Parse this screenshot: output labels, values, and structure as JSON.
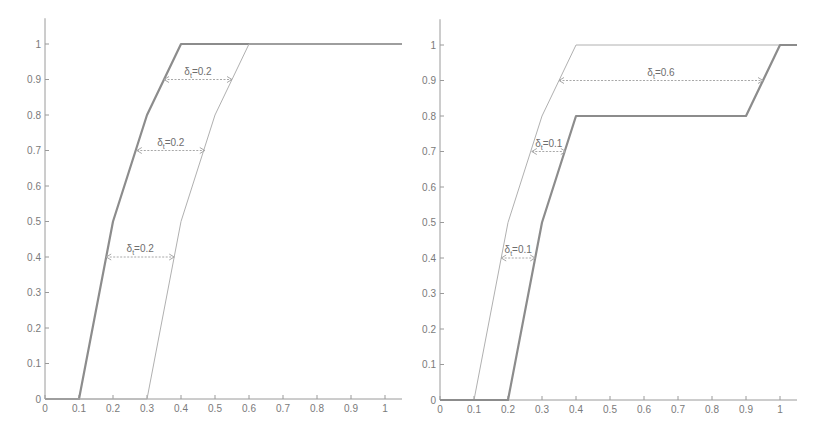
{
  "chart_data": [
    {
      "type": "line",
      "title": "",
      "xlabel": "",
      "ylabel": "",
      "xlim": [
        0,
        1.05
      ],
      "ylim": [
        0,
        1.05
      ],
      "grid": false,
      "x_ticks": [
        "0",
        "0.1",
        "0.2",
        "0.3",
        "0.4",
        "0.5",
        "0.6",
        "0.7",
        "0.8",
        "0.9",
        "1"
      ],
      "y_ticks": [
        "0",
        "0.1",
        "0.2",
        "0.3",
        "0.4",
        "0.5",
        "0.6",
        "0.7",
        "0.8",
        "0.9",
        "1"
      ],
      "series": [
        {
          "name": "thick",
          "style": "thick",
          "x": [
            0,
            0.1,
            0.2,
            0.3,
            0.4,
            1.05
          ],
          "y": [
            0,
            0,
            0.5,
            0.8,
            1.0,
            1.0
          ]
        },
        {
          "name": "thin",
          "style": "thin",
          "x": [
            0,
            0.3,
            0.4,
            0.5,
            0.6,
            1.05
          ],
          "y": [
            0,
            0,
            0.5,
            0.8,
            1.0,
            1.0
          ]
        }
      ],
      "annotations": [
        {
          "label": "δt=0.2",
          "y": 0.9,
          "x_from": 0.35,
          "x_to": 0.55
        },
        {
          "label": "δt=0.2",
          "y": 0.7,
          "x_from": 0.27,
          "x_to": 0.47
        },
        {
          "label": "δt=0.2",
          "y": 0.4,
          "x_from": 0.18,
          "x_to": 0.38
        }
      ]
    },
    {
      "type": "line",
      "title": "",
      "xlabel": "",
      "ylabel": "",
      "xlim": [
        0,
        1.05
      ],
      "ylim": [
        0,
        1.05
      ],
      "grid": false,
      "x_ticks": [
        "0",
        "0.1",
        "0.2",
        "0.3",
        "0.4",
        "0.5",
        "0.6",
        "0.7",
        "0.8",
        "0.9",
        "1"
      ],
      "y_ticks": [
        "0",
        "0.1",
        "0.2",
        "0.3",
        "0.4",
        "0.5",
        "0.6",
        "0.7",
        "0.8",
        "0.9",
        "1"
      ],
      "series": [
        {
          "name": "thin",
          "style": "thin",
          "x": [
            0,
            0.1,
            0.2,
            0.3,
            0.4,
            1.0
          ],
          "y": [
            0,
            0,
            0.5,
            0.8,
            1.0,
            1.0
          ]
        },
        {
          "name": "thick",
          "style": "thick",
          "x": [
            0,
            0.2,
            0.3,
            0.4,
            0.9,
            1.0,
            1.05
          ],
          "y": [
            0,
            0,
            0.5,
            0.8,
            0.8,
            1.0,
            1.0
          ]
        }
      ],
      "annotations": [
        {
          "label": "δt=0.6",
          "y": 0.9,
          "x_from": 0.35,
          "x_to": 0.95
        },
        {
          "label": "δt=0.1",
          "y": 0.7,
          "x_from": 0.27,
          "x_to": 0.37
        },
        {
          "label": "δt=0.1",
          "y": 0.4,
          "x_from": 0.18,
          "x_to": 0.28
        }
      ]
    }
  ],
  "plots": [
    {
      "ox": 45,
      "oy": 399,
      "sx": 340,
      "sy": 355
    },
    {
      "ox": 440,
      "oy": 400,
      "sx": 340,
      "sy": 355
    }
  ]
}
